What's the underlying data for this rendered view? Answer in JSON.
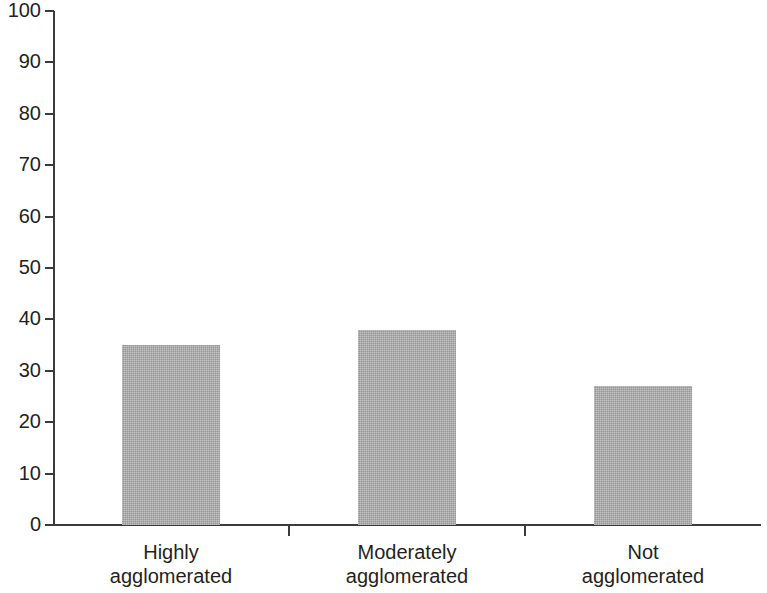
{
  "chart_data": {
    "type": "bar",
    "title": "",
    "subtitle": "",
    "xlabel": "",
    "ylabel": "",
    "categories": [
      "Highly agglomerated",
      "Moderately agglomerated",
      "Not agglomerated"
    ],
    "category_lines": [
      [
        "Highly",
        "agglomerated"
      ],
      [
        "Moderately",
        "agglomerated"
      ],
      [
        "Not",
        "agglomerated"
      ]
    ],
    "values": [
      35,
      38,
      27
    ],
    "ylim": [
      0,
      100
    ],
    "ytick_labels": [
      "0",
      "10",
      "20",
      "30",
      "40",
      "50",
      "60",
      "70",
      "80",
      "90",
      "100"
    ],
    "ytick_values": [
      0,
      10,
      20,
      30,
      40,
      50,
      60,
      70,
      80,
      90,
      100
    ],
    "ystep": 10,
    "grid": false,
    "legend": null,
    "legend_position": "none",
    "bar_color": "#a9a9a9",
    "axis_color": "#3b3b3b",
    "text_color": "#231f20",
    "annotations": []
  }
}
